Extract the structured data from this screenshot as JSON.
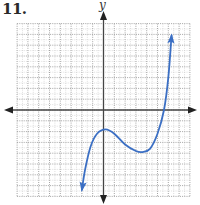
{
  "problem": {
    "number": "11."
  },
  "chart_data": {
    "type": "line",
    "title": "",
    "xlabel": "",
    "ylabel": "y",
    "xlim": [
      -8,
      8
    ],
    "ylim": [
      -8,
      8
    ],
    "grid": true,
    "grid_minor_step": 0.5,
    "grid_major_step": 1,
    "tick_labels": false,
    "legend": null,
    "series": [
      {
        "name": "cubic curve",
        "color": "#3b6fc4",
        "arrows": [
          "start",
          "end"
        ],
        "points": [
          {
            "x": -2.0,
            "y": -7.4
          },
          {
            "x": -1.7,
            "y": -5.5
          },
          {
            "x": -1.2,
            "y": -3.4
          },
          {
            "x": -0.6,
            "y": -2.2
          },
          {
            "x": 0.2,
            "y": -1.8
          },
          {
            "x": 1.0,
            "y": -2.2
          },
          {
            "x": 2.0,
            "y": -3.2
          },
          {
            "x": 3.0,
            "y": -3.8
          },
          {
            "x": 3.6,
            "y": -3.9
          },
          {
            "x": 4.3,
            "y": -3.6
          },
          {
            "x": 5.0,
            "y": -2.2
          },
          {
            "x": 5.6,
            "y": 0.0
          },
          {
            "x": 6.0,
            "y": 3.0
          },
          {
            "x": 6.3,
            "y": 6.9
          }
        ],
        "features": {
          "local_max": {
            "x": 0.2,
            "y": -1.8
          },
          "local_min": {
            "x": 3.6,
            "y": -3.9
          },
          "x_intercept": 5.6
        }
      }
    ]
  },
  "colors": {
    "curve": "#3b6fc4",
    "axis": "#444444",
    "grid_major": "#9a9a9a",
    "grid_minor": "#c8c8c8"
  }
}
